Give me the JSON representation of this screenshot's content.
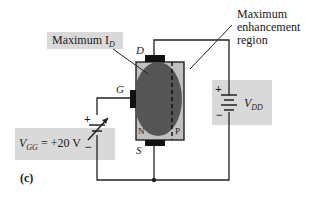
{
  "diagram": {
    "figure_label": "(c)",
    "callouts": {
      "max_id": {
        "text": "Maximum I",
        "subscript": "D"
      },
      "enhancement": {
        "line1": "Maximum",
        "line2": "enhancement",
        "line3": "region"
      }
    },
    "terminals": {
      "drain": "D",
      "gate": "G",
      "source": "S"
    },
    "regions": {
      "n": "N",
      "p": "P"
    },
    "sources": {
      "vgg": {
        "symbol": "V",
        "subscript": "GG",
        "value": "= +20 V",
        "plus": "+",
        "minus": "−"
      },
      "vdd": {
        "symbol": "V",
        "subscript": "DD",
        "plus": "+",
        "minus": "−"
      }
    },
    "colors": {
      "callout_bg": "#d9d9d9",
      "device_body": "#c0c0c0",
      "channel_oval": "#555555",
      "wire": "#222222"
    }
  }
}
